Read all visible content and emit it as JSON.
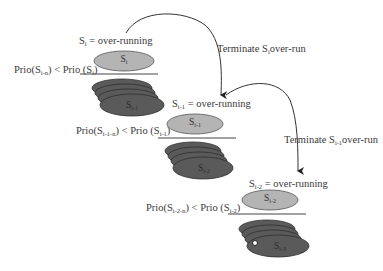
{
  "diagram": {
    "levels": [
      {
        "task": "S",
        "task_sub": "i",
        "status_text": " = over-running",
        "ellipse_label": "S",
        "ellipse_sub": "i",
        "priority_prefix": "Prio(S",
        "priority_sub_left": "i-n",
        "priority_mid": ") < Prio (S",
        "priority_sub_right": "i",
        "priority_suffix": ")",
        "stack_label": "S",
        "stack_sub": "i-1"
      },
      {
        "task": "S",
        "task_sub": "i-1",
        "status_text": " = over-running",
        "ellipse_label": "S",
        "ellipse_sub": "i-1",
        "priority_prefix": "Prio(S",
        "priority_sub_left": "i-1-n",
        "priority_mid": ") < Prio (S",
        "priority_sub_right": "i-1",
        "priority_suffix": ")",
        "stack_label": "S",
        "stack_sub": "i-2"
      },
      {
        "task": "S",
        "task_sub": "i-2",
        "status_text": " = over-running",
        "ellipse_label": "S",
        "ellipse_sub": "i-2",
        "priority_prefix": "Prio(S",
        "priority_sub_left": "i-2-n",
        "priority_mid": ") < Prio (S",
        "priority_sub_right": "i-2",
        "priority_suffix": ")",
        "stack_label": "S",
        "stack_sub": "i-3"
      }
    ],
    "arrows": [
      {
        "prefix": "Terminate S",
        "sub": "i",
        "suffix": "over-run"
      },
      {
        "prefix": "Terminate S",
        "sub": "i-1",
        "suffix": "over-run"
      }
    ],
    "colors": {
      "active_ellipse": "#b4b4b4",
      "stack_ellipse": "#5a5a5a",
      "stack_outline": "#2e2e2e",
      "line": "#444444"
    }
  }
}
